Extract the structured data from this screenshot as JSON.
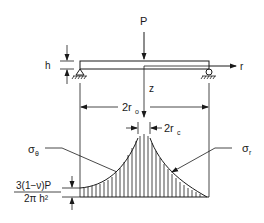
{
  "diagram": {
    "labels": {
      "load": "P",
      "thickness": "h",
      "radial_axis": "r",
      "vertical_axis": "z",
      "outer_radius": "2r",
      "outer_radius_sub": "o",
      "contact_radius": "2r",
      "contact_radius_sub": "c",
      "sigma_theta": "σ",
      "sigma_theta_sub": "θ",
      "sigma_r": "σ",
      "sigma_r_sub": "r",
      "edge_stress_numerator": "3(1−ν)P",
      "edge_stress_denominator": "2π h²"
    },
    "colors": {
      "ink": "#1a1a1a",
      "background": "#ffffff"
    }
  }
}
